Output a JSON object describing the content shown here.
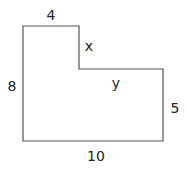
{
  "diagram": {
    "type": "composite-rectangle-L-shape",
    "stroke_color": "#555555",
    "text_color": "#222222",
    "labels": {
      "top": "4",
      "notch_vertical": "x",
      "notch_horizontal": "y",
      "left": "8",
      "right": "5",
      "bottom": "10"
    }
  }
}
